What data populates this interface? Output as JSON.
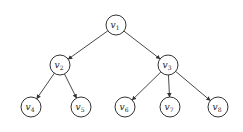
{
  "diagram": {
    "type": "tree",
    "nodes": [
      {
        "id": "v1",
        "base": "v",
        "sub": "1"
      },
      {
        "id": "v2",
        "base": "v",
        "sub": "2"
      },
      {
        "id": "v3",
        "base": "v",
        "sub": "3"
      },
      {
        "id": "v4",
        "base": "v",
        "sub": "4"
      },
      {
        "id": "v5",
        "base": "v",
        "sub": "5"
      },
      {
        "id": "v6",
        "base": "v",
        "sub": "6"
      },
      {
        "id": "v7",
        "base": "v",
        "sub": "7"
      },
      {
        "id": "v8",
        "base": "v",
        "sub": "8"
      }
    ],
    "edges": [
      {
        "from": "v1",
        "to": "v2"
      },
      {
        "from": "v1",
        "to": "v3"
      },
      {
        "from": "v2",
        "to": "v4"
      },
      {
        "from": "v2",
        "to": "v5"
      },
      {
        "from": "v3",
        "to": "v6"
      },
      {
        "from": "v3",
        "to": "v7"
      },
      {
        "from": "v3",
        "to": "v8"
      }
    ],
    "directed": true
  }
}
